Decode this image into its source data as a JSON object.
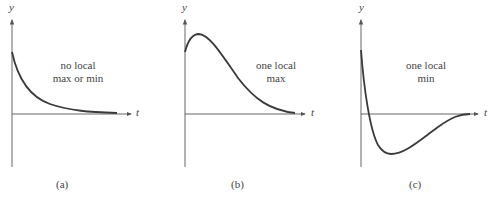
{
  "panels": [
    {
      "id": "a",
      "caption": "(a)",
      "annotation_line1": "no local",
      "annotation_line2": "max or min",
      "x_axis_label": "t",
      "y_axis_label": "y"
    },
    {
      "id": "b",
      "caption": "(b)",
      "annotation_line1": "one local",
      "annotation_line2": "max",
      "x_axis_label": "t",
      "y_axis_label": "y"
    },
    {
      "id": "c",
      "caption": "(c)",
      "annotation_line1": "one local",
      "annotation_line2": "min",
      "x_axis_label": "t",
      "y_axis_label": "y"
    }
  ],
  "colors": {
    "curve": "#3a3a3a",
    "axis": "#555555",
    "text": "#444444"
  }
}
